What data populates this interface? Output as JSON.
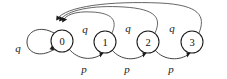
{
  "diagram": {
    "type": "state-transition-diagram",
    "title": "",
    "background_color": "#ffffff",
    "stroke_color": "#3a3a3a",
    "label_color": "#111111",
    "states": [
      {
        "id": "s0",
        "label": "0",
        "cx": 62,
        "cy": 41,
        "r": 11
      },
      {
        "id": "s1",
        "label": "1",
        "cx": 105,
        "cy": 42,
        "r": 11
      },
      {
        "id": "s2",
        "label": "2",
        "cx": 148,
        "cy": 42,
        "r": 11
      },
      {
        "id": "s3",
        "label": "3",
        "cx": 192,
        "cy": 42,
        "r": 11
      }
    ],
    "transitions": [
      {
        "id": "t-self-0",
        "from": "s0",
        "to": "s0",
        "label": "q",
        "label_x": 18,
        "label_y": 48,
        "kind": "self-loop"
      },
      {
        "id": "t-0-1",
        "from": "s0",
        "to": "s1",
        "label": "p",
        "label_x": 84,
        "label_y": 69,
        "kind": "forward-arc"
      },
      {
        "id": "t-1-2",
        "from": "s1",
        "to": "s2",
        "label": "p",
        "label_x": 127,
        "label_y": 69,
        "kind": "forward-arc"
      },
      {
        "id": "t-2-3",
        "from": "s2",
        "to": "s3",
        "label": "p",
        "label_x": 171,
        "label_y": 69,
        "kind": "forward-arc"
      },
      {
        "id": "t-1-0",
        "from": "s1",
        "to": "s0",
        "label": "q",
        "label_x": 85,
        "label_y": 29,
        "kind": "return-arc"
      },
      {
        "id": "t-2-0",
        "from": "s2",
        "to": "s0",
        "label": "q",
        "label_x": 128,
        "label_y": 28,
        "kind": "return-arc"
      },
      {
        "id": "t-3-0",
        "from": "s3",
        "to": "s0",
        "label": "q",
        "label_x": 172,
        "label_y": 28,
        "kind": "return-arc"
      }
    ]
  }
}
